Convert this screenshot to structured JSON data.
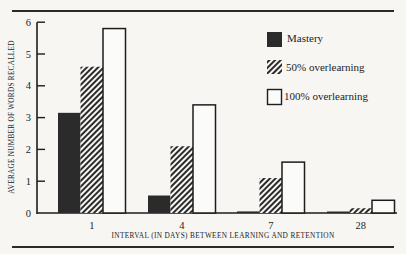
{
  "chart_data": {
    "type": "bar",
    "title": "",
    "xlabel": "INTERVAL (IN DAYS) BETWEEN LEARNING AND RETENTION",
    "ylabel": "AVERAGE NUMBER OF WORDS RECALLED",
    "categories": [
      "1",
      "4",
      "7",
      "28"
    ],
    "series": [
      {
        "name": "Mastery",
        "pattern": "solid-dark",
        "values": [
          3.15,
          0.55,
          0.05,
          0.02
        ]
      },
      {
        "name": "50% overlearning",
        "pattern": "diagonal-hatch",
        "values": [
          4.6,
          2.1,
          1.1,
          0.15
        ]
      },
      {
        "name": "100% overlearning",
        "pattern": "outline-white",
        "values": [
          5.8,
          3.4,
          1.6,
          0.4
        ]
      }
    ],
    "yticks": [
      0,
      1,
      2,
      3,
      4,
      5,
      6
    ],
    "ylim": [
      0,
      6
    ],
    "grid": false,
    "legend_position": "upper-right"
  },
  "axis": {
    "xlabel": "INTERVAL (IN DAYS) BETWEEN LEARNING AND RETENTION",
    "ylabel": "AVERAGE NUMBER OF WORDS RECALLED"
  },
  "legend": {
    "mastery": "Mastery",
    "half": "50% overlearning",
    "full": "100% overlearning"
  },
  "colors": {
    "mastery_fill": "#2b2b2b",
    "hatch": "#2b2b2b",
    "outline": "#1d1d1d",
    "background": "#f7f6f3"
  }
}
